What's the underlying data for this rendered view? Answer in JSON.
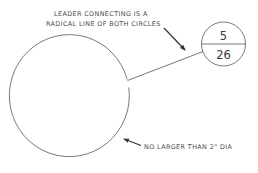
{
  "diagram": {
    "annotations": {
      "leader_note_line1": "LEADER CONNECTING IS A",
      "leader_note_line2": "RADICAL LINE OF BOTH CIRCLES",
      "size_note": "NO LARGER THAN 2\" DIA"
    },
    "balloon": {
      "top_value": "5",
      "bottom_value": "26"
    },
    "colors": {
      "line": "#555555",
      "text": "#4a4a4a",
      "background": "#ffffff"
    }
  }
}
